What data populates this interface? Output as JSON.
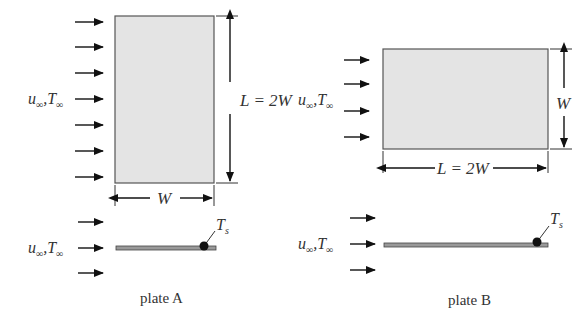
{
  "plate_a": {
    "caption": "plate A",
    "flow_label_u": "u",
    "flow_label_sep": ",",
    "flow_label_T": "T",
    "inf": "∞",
    "length_label": "L = 2W",
    "width_label": "W",
    "surface_temp_label": "T",
    "surface_temp_sub": "s",
    "flow_arrow_count_top": 7,
    "flow_arrow_count_side": 3
  },
  "plate_b": {
    "caption": "plate B",
    "flow_label_u": "u",
    "flow_label_sep": ",",
    "flow_label_T": "T",
    "inf": "∞",
    "length_label": "L = 2W",
    "width_label": "W",
    "surface_temp_label": "T",
    "surface_temp_sub": "s",
    "flow_arrow_count_top": 4,
    "flow_arrow_count_side": 3
  },
  "colors": {
    "plate_fill": "#e4e4e4",
    "plate_edge": "#555555",
    "arrow": "#111111"
  }
}
